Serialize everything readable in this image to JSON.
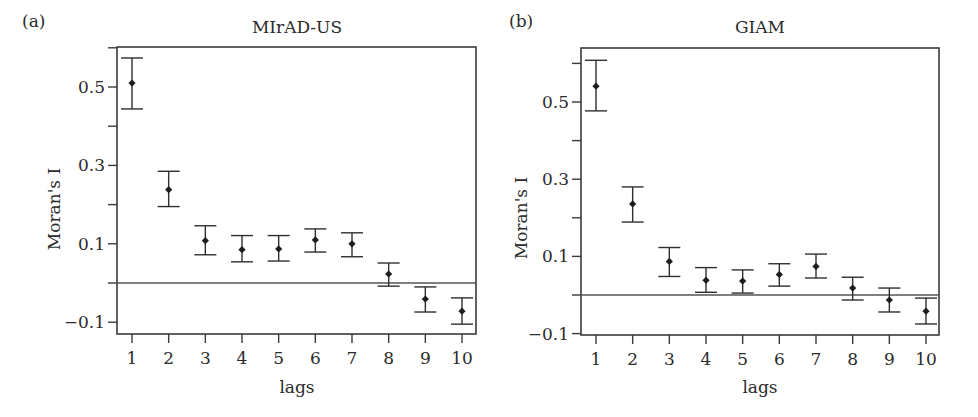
{
  "figure": {
    "panels": [
      {
        "panel_label": "(a)",
        "title": "MIrAD-US",
        "xlabel": "lags",
        "ylabel": "Moran's I"
      },
      {
        "panel_label": "(b)",
        "title": "GIAM",
        "xlabel": "lags",
        "ylabel": "Moran's I"
      }
    ]
  },
  "chart_data": [
    {
      "type": "scatter",
      "subtype": "point-with-error-bars",
      "panel_label": "(a)",
      "title": "MIrAD-US",
      "xlabel": "lags",
      "ylabel": "Moran's I",
      "x": [
        1,
        2,
        3,
        4,
        5,
        6,
        7,
        8,
        9,
        10
      ],
      "x_tick_labels": [
        "1",
        "2",
        "3",
        "4",
        "5",
        "6",
        "7",
        "8",
        "9",
        "10"
      ],
      "y_tick_labels": [
        "0.5",
        "0.3",
        "0.1",
        "-0.1"
      ],
      "y_ticks": [
        -0.1,
        0.0,
        0.1,
        0.2,
        0.3,
        0.4,
        0.5,
        0.6
      ],
      "ylim": [
        -0.13,
        0.61
      ],
      "reference_line_y": 0.0,
      "grid": false,
      "series": [
        {
          "name": "Moran's I",
          "values": [
            0.51,
            0.238,
            0.108,
            0.085,
            0.087,
            0.11,
            0.1,
            0.023,
            -0.041,
            -0.072
          ],
          "upper": [
            0.574,
            0.285,
            0.146,
            0.121,
            0.121,
            0.138,
            0.128,
            0.051,
            -0.01,
            -0.038
          ],
          "lower": [
            0.444,
            0.195,
            0.072,
            0.054,
            0.056,
            0.079,
            0.067,
            -0.008,
            -0.074,
            -0.105
          ]
        }
      ]
    },
    {
      "type": "scatter",
      "subtype": "point-with-error-bars",
      "panel_label": "(b)",
      "title": "GIAM",
      "xlabel": "lags",
      "ylabel": "Moran's I",
      "x": [
        1,
        2,
        3,
        4,
        5,
        6,
        7,
        8,
        9,
        10
      ],
      "x_tick_labels": [
        "1",
        "2",
        "3",
        "4",
        "5",
        "6",
        "7",
        "8",
        "9",
        "10"
      ],
      "y_tick_labels": [
        "0.5",
        "0.3",
        "0.1",
        "-0.1"
      ],
      "y_ticks": [
        -0.1,
        0.0,
        0.1,
        0.2,
        0.3,
        0.4,
        0.5,
        0.6
      ],
      "ylim": [
        -0.11,
        0.64
      ],
      "reference_line_y": 0.0,
      "grid": false,
      "series": [
        {
          "name": "Moran's I",
          "values": [
            0.541,
            0.236,
            0.087,
            0.038,
            0.036,
            0.053,
            0.074,
            0.018,
            -0.013,
            -0.042
          ],
          "upper": [
            0.608,
            0.28,
            0.123,
            0.071,
            0.065,
            0.081,
            0.106,
            0.046,
            0.018,
            -0.008
          ],
          "lower": [
            0.477,
            0.189,
            0.048,
            0.007,
            0.005,
            0.023,
            0.044,
            -0.013,
            -0.044,
            -0.075
          ]
        }
      ]
    }
  ]
}
